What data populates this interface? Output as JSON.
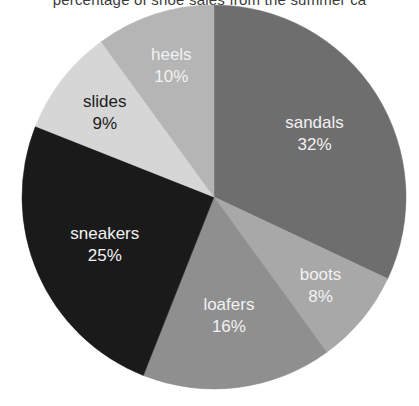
{
  "chart_data": {
    "type": "pie",
    "title": "percentage of shoe sales from the summer ca",
    "title_truncated": true,
    "categories": [
      "sandals",
      "boots",
      "loafers",
      "sneakers",
      "slides",
      "heels"
    ],
    "values": [
      32,
      8,
      16,
      25,
      9,
      10
    ],
    "value_suffix": "%",
    "labels": [
      {
        "name": "sandals",
        "value": 32,
        "value_text": "32%",
        "color": "#6e6e6e",
        "text_color": "#f2f2f2",
        "text_tone": "light"
      },
      {
        "name": "boots",
        "value": 8,
        "value_text": "8%",
        "color": "#a8a8a8",
        "text_color": "#f2f2f2",
        "text_tone": "light"
      },
      {
        "name": "loafers",
        "value": 16,
        "value_text": "16%",
        "color": "#8f8f8f",
        "text_color": "#f2f2f2",
        "text_tone": "light"
      },
      {
        "name": "sneakers",
        "value": 25,
        "value_text": "25%",
        "color": "#1a1a1a",
        "text_color": "#f2f2f2",
        "text_tone": "light"
      },
      {
        "name": "slides",
        "value": 9,
        "value_text": "9%",
        "color": "#d6d6d6",
        "text_color": "#1c1c1c",
        "text_tone": "dark"
      },
      {
        "name": "heels",
        "value": 10,
        "value_text": "10%",
        "color": "#b5b5b5",
        "text_color": "#f2f2f2",
        "text_tone": "light"
      }
    ],
    "start_angle_deg": 0,
    "direction": "clockwise",
    "legend": "none",
    "grid": false,
    "background": "#ffffff",
    "geometry": {
      "cx": 214,
      "cy": 197,
      "r": 192
    }
  }
}
